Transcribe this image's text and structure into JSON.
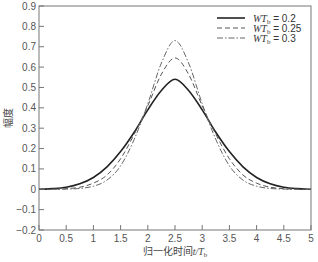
{
  "chart_data": {
    "type": "line",
    "title": "",
    "xlabel": "归一化时间t/T_b",
    "xlabel_main": "归一化时间",
    "xlabel_var": "t/T",
    "xlabel_sub": "b",
    "ylabel": "幅度",
    "xlim": [
      0,
      5
    ],
    "ylim": [
      -0.2,
      0.9
    ],
    "x_ticks": [
      "0",
      "0.5",
      "1",
      "1.5",
      "2",
      "2.5",
      "3",
      "3.5",
      "4",
      "4.5",
      "5"
    ],
    "y_ticks": [
      "-0.2",
      "-0.1",
      "0",
      "0.1",
      "0.2",
      "0.3",
      "0.4",
      "0.5",
      "0.6",
      "0.7",
      "0.8",
      "0.9"
    ],
    "grid": false,
    "legend_position": "upper right",
    "series": [
      {
        "name": "WT_b = 0.2",
        "label_prefix": "WT",
        "label_sub": "b",
        "label_suffix": " = 0.2",
        "style": "solid",
        "color": "#222222",
        "x": [
          0,
          0.25,
          0.5,
          0.75,
          1,
          1.25,
          1.5,
          1.75,
          2,
          2.25,
          2.5,
          2.75,
          3,
          3.25,
          3.5,
          3.75,
          4,
          4.25,
          4.5,
          4.75,
          5
        ],
        "values": [
          0.0,
          0.003,
          0.01,
          0.027,
          0.058,
          0.11,
          0.185,
          0.28,
          0.39,
          0.485,
          0.54,
          0.485,
          0.39,
          0.28,
          0.185,
          0.11,
          0.058,
          0.027,
          0.01,
          0.003,
          0.0
        ]
      },
      {
        "name": "WT_b = 0.25",
        "label_prefix": "WT",
        "label_sub": "b",
        "label_suffix": " = 0.25",
        "style": "dashed",
        "color": "#555555",
        "x": [
          0,
          0.25,
          0.5,
          0.75,
          1,
          1.25,
          1.5,
          1.75,
          2,
          2.25,
          2.5,
          2.75,
          3,
          3.25,
          3.5,
          3.75,
          4,
          4.25,
          4.5,
          4.75,
          5
        ],
        "values": [
          0.0,
          0.0,
          0.003,
          0.01,
          0.03,
          0.07,
          0.15,
          0.27,
          0.41,
          0.565,
          0.645,
          0.565,
          0.41,
          0.27,
          0.15,
          0.07,
          0.03,
          0.01,
          0.003,
          0.0,
          0.0
        ]
      },
      {
        "name": "WT_b = 0.3",
        "label_prefix": "WT",
        "label_sub": "b",
        "label_suffix": " = 0.3",
        "style": "dashdot",
        "color": "#666666",
        "x": [
          0,
          0.25,
          0.5,
          0.75,
          1,
          1.25,
          1.5,
          1.75,
          2,
          2.25,
          2.5,
          2.75,
          3,
          3.25,
          3.5,
          3.75,
          4,
          4.25,
          4.5,
          4.75,
          5
        ],
        "values": [
          0.0,
          0.0,
          0.001,
          0.004,
          0.015,
          0.045,
          0.115,
          0.245,
          0.42,
          0.62,
          0.73,
          0.62,
          0.42,
          0.245,
          0.115,
          0.045,
          0.015,
          0.004,
          0.001,
          0.0,
          0.0
        ]
      }
    ]
  }
}
